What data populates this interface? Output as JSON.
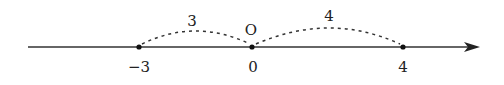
{
  "diagram": {
    "type": "number-line",
    "origin_label": "O",
    "points": [
      {
        "value": -3,
        "label": "−3"
      },
      {
        "value": 0,
        "label": "0"
      },
      {
        "value": 4,
        "label": "4"
      }
    ],
    "arcs": [
      {
        "from": -3,
        "to": 0,
        "label": "3"
      },
      {
        "from": 0,
        "to": 4,
        "label": "4"
      }
    ],
    "colors": {
      "line": "#333333",
      "text": "#222222"
    }
  }
}
